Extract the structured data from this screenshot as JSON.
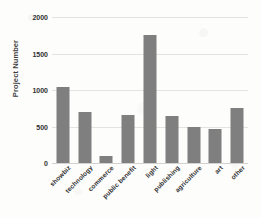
{
  "chart_data": {
    "type": "bar",
    "title": "",
    "subtitle": "",
    "xlabel": "",
    "ylabel": "Project Number",
    "categories": [
      "showbiz",
      "technology",
      "commerce",
      "public benefit",
      "light",
      "publishing",
      "agriculture",
      "art",
      "other"
    ],
    "values": [
      1040,
      700,
      90,
      660,
      1760,
      640,
      500,
      460,
      760
    ],
    "series": [
      {
        "name": "Project Number",
        "values": [
          1040,
          700,
          90,
          660,
          1760,
          640,
          500,
          460,
          760
        ]
      }
    ],
    "ylim": [
      0,
      2000
    ],
    "y_ticks": [
      0,
      500,
      1000,
      1500,
      2000
    ],
    "y_tick_labels": [
      "0",
      "500",
      "1000",
      "1500",
      "2000"
    ],
    "grid": true,
    "grid_axis": "y",
    "legend": false,
    "legend_position": "none",
    "bar_color": "#7f7f7f",
    "gridline_color": "#e3e3e3",
    "text_color": "#2f2f2f",
    "background_color": "#fdfdfc",
    "x_tick_label_rotation": -45,
    "annotations": []
  }
}
